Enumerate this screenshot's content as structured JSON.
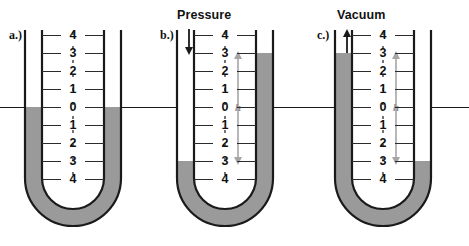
{
  "figure": {
    "colors": {
      "mercury": "#9a9a9a",
      "mercury_edge": "#6f6f6f",
      "tube_outline": "#1a1a1a",
      "tick": "#2b2b2b",
      "h_arrow": "#a6a6a6",
      "text": "#111111",
      "background": "#ffffff"
    },
    "scale_labels": [
      "4",
      "3",
      "2",
      "1",
      "0",
      "1",
      "2",
      "3",
      "4"
    ],
    "panels": [
      {
        "id": "a",
        "label": "a.)",
        "caption": "",
        "caption_arrow": "none",
        "left_level_label": "0",
        "right_level_label": "0",
        "h_label": "",
        "h_shown": false
      },
      {
        "id": "b",
        "label": "b.)",
        "caption": "Pressure",
        "caption_arrow": "down",
        "left_level_label": "-3",
        "right_level_label": "+3",
        "h_label": "h",
        "h_shown": true
      },
      {
        "id": "c",
        "label": "c.)",
        "caption": "Vacuum",
        "caption_arrow": "up",
        "left_level_label": "+3",
        "right_level_label": "-3",
        "h_label": "h",
        "h_shown": true
      }
    ]
  }
}
